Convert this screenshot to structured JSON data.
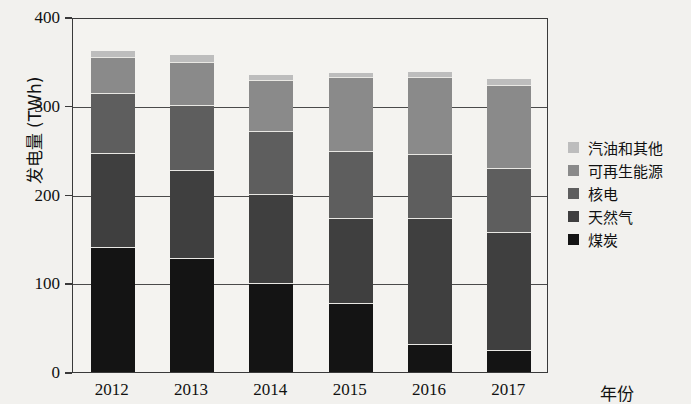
{
  "chart_data": {
    "type": "bar",
    "stacked": true,
    "title": "",
    "xlabel": "年份",
    "ylabel": "发电量 (TWh)",
    "categories": [
      "2012",
      "2013",
      "2014",
      "2015",
      "2016",
      "2017"
    ],
    "ylim": [
      0,
      400
    ],
    "yticks": [
      0,
      100,
      200,
      300,
      400
    ],
    "ytick_labels": [
      "0",
      "100",
      "200",
      "300",
      "400"
    ],
    "grid": true,
    "legend_position": "right",
    "series": [
      {
        "name": "煤炭",
        "color": "#141414",
        "values": [
          141,
          128,
          100,
          78,
          32,
          25
        ]
      },
      {
        "name": "天然气",
        "color": "#3f3f3f",
        "values": [
          106,
          100,
          101,
          95,
          142,
          133
        ]
      },
      {
        "name": "核电",
        "color": "#5e5e5e",
        "values": [
          67,
          73,
          71,
          76,
          72,
          72
        ]
      },
      {
        "name": "可再生能源",
        "color": "#8a8a8a",
        "values": [
          41,
          48,
          57,
          83,
          86,
          93
        ]
      },
      {
        "name": "汽油和其他",
        "color": "#bdbdbd",
        "values": [
          7,
          8,
          6,
          5,
          6,
          7
        ]
      }
    ],
    "totals": [
      362,
      357,
      335,
      337,
      338,
      330
    ],
    "legend_order": [
      "汽油和其他",
      "可再生能源",
      "核电",
      "天然气",
      "煤炭"
    ]
  },
  "axes": {
    "y_title": "发电量 (TWh)",
    "x_title": "年份"
  }
}
